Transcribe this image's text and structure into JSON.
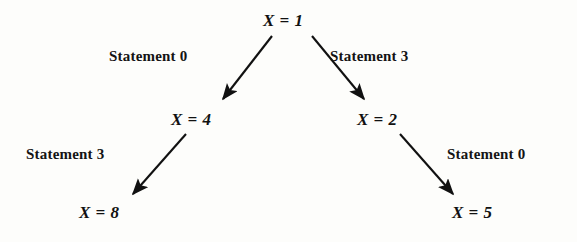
{
  "diagram": {
    "background_color": "#fdfdfb",
    "ink_color": "#111111",
    "nodes": [
      {
        "id": "root",
        "var": "X",
        "operator": "=",
        "value": "1",
        "label": "X = 1",
        "x": 290,
        "y": 21
      },
      {
        "id": "l",
        "var": "X",
        "operator": "=",
        "value": "4",
        "label": "X = 4",
        "x": 200,
        "y": 120
      },
      {
        "id": "r",
        "var": "X",
        "operator": "=",
        "value": "2",
        "label": "X = 2",
        "x": 386,
        "y": 120
      },
      {
        "id": "ll",
        "var": "X",
        "operator": "=",
        "value": "8",
        "label": "X = 8",
        "x": 108,
        "y": 213
      },
      {
        "id": "rr",
        "var": "X",
        "operator": "=",
        "value": "5",
        "label": "X = 5",
        "x": 481,
        "y": 213
      }
    ],
    "edges": [
      {
        "id": "root-l",
        "from": "root",
        "to": "l",
        "label": "Statement 0",
        "direction": "down-left",
        "x1": 272,
        "y1": 36,
        "x2": 221,
        "y2": 101
      },
      {
        "id": "root-r",
        "from": "root",
        "to": "r",
        "label": "Statement 3",
        "direction": "down-right",
        "x1": 312,
        "y1": 36,
        "x2": 366,
        "y2": 101
      },
      {
        "id": "l-ll",
        "from": "l",
        "to": "ll",
        "label": "Statement 3",
        "direction": "down-left",
        "x1": 186,
        "y1": 134,
        "x2": 131,
        "y2": 196
      },
      {
        "id": "r-rr",
        "from": "r",
        "to": "rr",
        "label": "Statement 0",
        "direction": "down-right",
        "x1": 400,
        "y1": 134,
        "x2": 455,
        "y2": 196
      }
    ]
  }
}
